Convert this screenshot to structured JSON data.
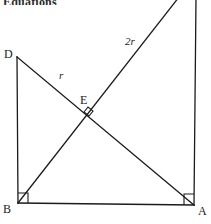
{
  "figure": {
    "header_text": "Equations",
    "width": 211,
    "height": 224,
    "background_color": "#ffffff",
    "stroke_color": "#1b1b1b",
    "labels": {
      "vertex_d": "D",
      "vertex_b": "B",
      "vertex_a": "A",
      "vertex_e": "E",
      "segment_r": "r",
      "segment_2r": "2r"
    },
    "points": {
      "D": {
        "x": 17,
        "y": 57
      },
      "B": {
        "x": 18,
        "y": 203
      },
      "A": {
        "x": 194,
        "y": 205
      },
      "E": {
        "x": 89,
        "y": 113
      },
      "top_right_corner": {
        "x": 196,
        "y": 0
      },
      "ray_2r_top": {
        "x": 178,
        "y": 0
      }
    },
    "segments": [
      {
        "name": "side-DB",
        "from": "D",
        "to": "B",
        "label": ""
      },
      {
        "name": "side-BA",
        "from": "B",
        "to": "A",
        "label": ""
      },
      {
        "name": "side-A-top",
        "from": "A",
        "to": "top_right_corner",
        "label": ""
      },
      {
        "name": "diagonal-DA",
        "from": "D",
        "to": "A",
        "label": "r"
      },
      {
        "name": "ray-B-top",
        "from": "B",
        "to": "ray_2r_top",
        "label": "2r"
      }
    ],
    "right_angles": [
      {
        "name": "right-angle-at-B",
        "x": 18,
        "y": 203
      },
      {
        "name": "right-angle-at-A",
        "x": 194,
        "y": 205
      },
      {
        "name": "right-angle-at-E",
        "x": 89,
        "y": 113
      }
    ]
  }
}
